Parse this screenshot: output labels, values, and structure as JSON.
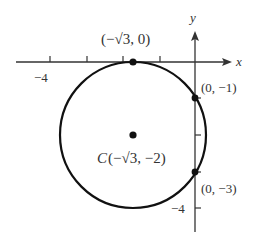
{
  "diagram": {
    "type": "circle-on-coordinate-plane",
    "axes": {
      "x_label": "x",
      "y_label": "y",
      "x_tick_label": "−4",
      "y_tick_label": "−4"
    },
    "circle": {
      "center_label": "C",
      "center_coords": "(−√3, −2)",
      "center": [
        -1.732,
        -2
      ],
      "radius": 2
    },
    "points": [
      {
        "name": "tangent-point",
        "label": "(−√3, 0)",
        "coords": [
          -1.732,
          0
        ]
      },
      {
        "name": "y-intercept-upper",
        "label": "(0, −1)",
        "coords": [
          0,
          -1
        ]
      },
      {
        "name": "y-intercept-lower",
        "label": "(0, −3)",
        "coords": [
          0,
          -3
        ]
      },
      {
        "name": "center",
        "label": "C(−√3, −2)",
        "coords": [
          -1.732,
          -2
        ]
      }
    ],
    "colors": {
      "stroke": "#111111",
      "axis": "#333333",
      "text": "#333333",
      "background": "#ffffff"
    }
  }
}
